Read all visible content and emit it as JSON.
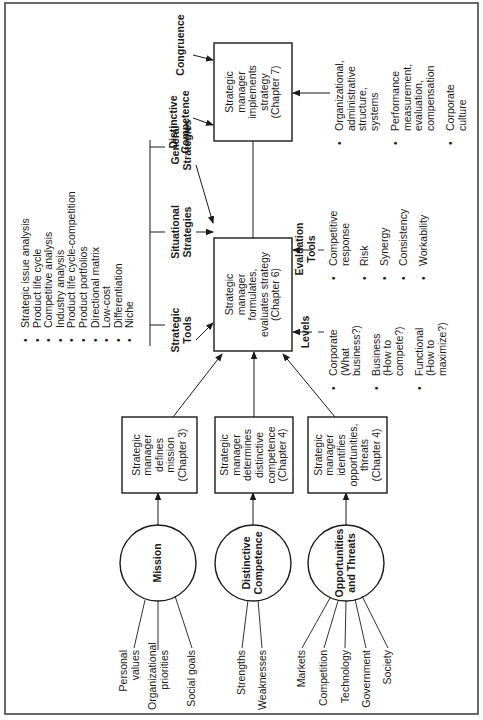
{
  "circles": {
    "mission": {
      "label": "Mission",
      "inputs": [
        "Personal values",
        "Organizational priorities",
        "Social goals"
      ]
    },
    "distinctive": {
      "label_1": "Distinctive",
      "label_2": "Competence",
      "inputs": [
        "Strengths",
        "Weaknesses"
      ]
    },
    "opportunities": {
      "label_1": "Opportunities",
      "label_2": "and Threats",
      "inputs": [
        "Markets",
        "Competition",
        "Technology",
        "Government",
        "Society"
      ]
    }
  },
  "boxes": {
    "defines": {
      "l1": "Strategic",
      "l2": "manager",
      "l3": "defines",
      "l4": "mission",
      "l5": "(Chapter 3)"
    },
    "determines": {
      "l1": "Strategic",
      "l2": "manager",
      "l3": "determines",
      "l4": "distinctive",
      "l5": "competence",
      "l6": "(Chapter 4)"
    },
    "identifies": {
      "l1": "Strategic",
      "l2": "manager",
      "l3": "identifies",
      "l4": "opportunities,",
      "l5": "threats",
      "l6": "(Chapter 4)"
    },
    "formulates": {
      "l1": "Strategic",
      "l2": "manager",
      "l3": "formulates,",
      "l4": "evaluates strategy",
      "l5": "(Chapter 6)"
    },
    "implements": {
      "l1": "Strategic",
      "l2": "manager",
      "l3": "implements",
      "l4": "strategy",
      "l5": "(Chapter 7)"
    }
  },
  "strategic_tools": {
    "items": [
      "Strategic issue analysis",
      "Product life cycle",
      "Competitive analysis",
      "Industry analysis",
      "Product life cycle-competition",
      "Product portfolios",
      "Directional matrix",
      "Low-cost",
      "Differentiation",
      "Niche"
    ],
    "labels": {
      "tools_1": "Strategic",
      "tools_2": "Tools",
      "situational_1": "Situational",
      "situational_2": "Strategies",
      "general_1": "General",
      "general_2": "Strategies"
    }
  },
  "implementation_inputs": {
    "distinctive_1": "Distinctive",
    "distinctive_2": "Competence",
    "congruence": "Congruence",
    "items": [
      {
        "l1": "Organizational,",
        "l2": "administrative",
        "l3": "structure,",
        "l4": "systems"
      },
      {
        "l1": "Performance",
        "l2": "measurement,",
        "l3": "evaluation,",
        "l4": "compensation"
      },
      {
        "l1": "Corporate",
        "l2": "culture"
      }
    ]
  },
  "levels": {
    "title": "Levels",
    "items": [
      {
        "l1": "Corporate",
        "l2": "(What",
        "l3": "business?)"
      },
      {
        "l1": "Business",
        "l2": "(How to",
        "l3": "compete?)"
      },
      {
        "l1": "Functional",
        "l2": "(How to",
        "l3": "maximize?)"
      }
    ]
  },
  "evaluation_tools": {
    "title_1": "Evaluation",
    "title_2": "Tools",
    "items": [
      {
        "l1": "Competitive",
        "l2": "response"
      },
      {
        "l1": "Risk"
      },
      {
        "l1": "Synergy"
      },
      {
        "l1": "Consistency"
      },
      {
        "l1": "Workability"
      }
    ]
  }
}
